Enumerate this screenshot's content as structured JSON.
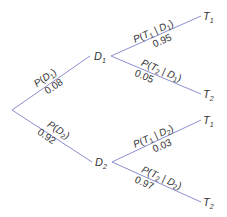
{
  "diagram": {
    "type": "probability-tree",
    "edge_color": "#8c8fd0",
    "root": {},
    "level1": [
      {
        "node": "D",
        "node_sub": "1",
        "label_top": "P(D",
        "label_top_sub": "1",
        "label_top_end": ")",
        "value": "0.08"
      },
      {
        "node": "D",
        "node_sub": "2",
        "label_top": "P(D",
        "label_top_sub": "2",
        "label_top_end": ")",
        "value": "0.92"
      }
    ],
    "level2": [
      {
        "parent": "D1",
        "node": "T",
        "node_sub": "1",
        "label": "P(T1 | D1)",
        "value": "0.95"
      },
      {
        "parent": "D1",
        "node": "T",
        "node_sub": "2",
        "label": "P(T2 | D1)",
        "value": "0.05"
      },
      {
        "parent": "D2",
        "node": "T",
        "node_sub": "1",
        "label": "P(T1 | D2)",
        "value": "0.03"
      },
      {
        "parent": "D2",
        "node": "T",
        "node_sub": "2",
        "label": "P(T2 | D2)",
        "value": "0.97"
      }
    ],
    "text": {
      "P": "P(",
      "T": "T",
      "D": "D",
      "bar": " | ",
      "close": ")",
      "one": "1",
      "two": "2"
    }
  }
}
